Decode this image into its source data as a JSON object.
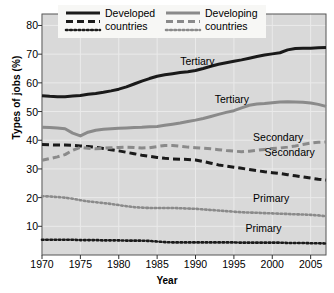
{
  "chart_data": {
    "type": "line",
    "title": "",
    "xlabel": "Year",
    "ylabel": "Types of jobs (%)",
    "xlim": [
      1970,
      2007
    ],
    "ylim": [
      0,
      84
    ],
    "xticks": [
      1970,
      1975,
      1980,
      1985,
      1990,
      1995,
      2000,
      2005
    ],
    "yticks": [
      10,
      20,
      30,
      40,
      50,
      60,
      70,
      80
    ],
    "grid": true,
    "legend_position": "top-center",
    "plot_background": "#d9d9d9",
    "gridline_color": "#eaeaea",
    "colors": {
      "developed": "#1a1a1a",
      "developing": "#8a8a8a"
    },
    "legend": [
      {
        "group": "developed",
        "label_line1": "Developed",
        "label_line2": "countries",
        "styles": [
          "solid",
          "dashed",
          "dotted"
        ],
        "color": "#1a1a1a"
      },
      {
        "group": "developing",
        "label_line1": "Developing",
        "label_line2": "countries",
        "styles": [
          "solid",
          "dashed",
          "dotted"
        ],
        "color": "#8a8a8a"
      }
    ],
    "annotations": [
      {
        "text": "Tertiary",
        "series": "developed_tertiary",
        "x": 1988.0,
        "y": 67.5
      },
      {
        "text": "Tertiary",
        "series": "developing_tertiary",
        "x": 1992.5,
        "y": 54.5
      },
      {
        "text": "Secondary",
        "series": "developing_secondary",
        "x": 1997.5,
        "y": 41.0
      },
      {
        "text": "Secondary",
        "series": "developed_secondary",
        "x": 1999.0,
        "y": 36.0
      },
      {
        "text": "Primary",
        "series": "developing_primary",
        "x": 1997.5,
        "y": 20.0
      },
      {
        "text": "Primary",
        "series": "developed_primary",
        "x": 1996.5,
        "y": 9.5
      }
    ],
    "x": [
      1970,
      1971,
      1972,
      1973,
      1974,
      1975,
      1976,
      1977,
      1978,
      1979,
      1980,
      1981,
      1982,
      1983,
      1984,
      1985,
      1986,
      1987,
      1988,
      1989,
      1990,
      1991,
      1992,
      1993,
      1994,
      1995,
      1996,
      1997,
      1998,
      1999,
      2000,
      2001,
      2002,
      2003,
      2004,
      2005,
      2006,
      2007
    ],
    "series": [
      {
        "name": "Developed countries - Tertiary",
        "group": "developed",
        "category": "Tertiary",
        "style": "solid",
        "color": "#1a1a1a",
        "values": [
          55.5,
          55.3,
          55.2,
          55.2,
          55.4,
          55.6,
          56.0,
          56.3,
          56.7,
          57.2,
          57.8,
          58.6,
          59.6,
          60.6,
          61.5,
          62.3,
          62.8,
          63.2,
          63.6,
          63.9,
          64.3,
          65.0,
          65.8,
          66.5,
          67.0,
          67.5,
          68.0,
          68.6,
          69.2,
          69.7,
          70.1,
          70.5,
          71.5,
          72.0,
          72.1,
          72.1,
          72.2,
          72.3
        ]
      },
      {
        "name": "Developing countries - Tertiary",
        "group": "developing",
        "category": "Tertiary",
        "style": "solid",
        "color": "#8a8a8a",
        "values": [
          44.5,
          44.4,
          44.3,
          44.0,
          42.5,
          41.5,
          42.8,
          43.5,
          43.8,
          44.0,
          44.2,
          44.3,
          44.4,
          44.5,
          44.7,
          44.8,
          45.2,
          45.6,
          46.0,
          46.5,
          47.0,
          47.6,
          48.3,
          49.0,
          49.7,
          50.3,
          51.3,
          52.2,
          52.6,
          52.8,
          53.1,
          53.3,
          53.4,
          53.3,
          53.2,
          53.0,
          52.5,
          51.8
        ]
      },
      {
        "name": "Developed countries - Secondary",
        "group": "developed",
        "category": "Secondary",
        "style": "dashed",
        "color": "#1a1a1a",
        "values": [
          38.5,
          38.4,
          38.3,
          38.3,
          38.2,
          38.0,
          37.8,
          37.5,
          37.1,
          36.7,
          36.3,
          35.8,
          35.3,
          34.8,
          34.4,
          34.0,
          33.7,
          33.5,
          33.4,
          33.3,
          33.1,
          32.6,
          32.0,
          31.4,
          31.0,
          30.6,
          30.2,
          29.8,
          29.4,
          29.0,
          28.7,
          28.4,
          28.0,
          27.6,
          27.2,
          26.8,
          26.4,
          26.1
        ]
      },
      {
        "name": "Developing countries - Secondary",
        "group": "developing",
        "category": "Secondary",
        "style": "dashed",
        "color": "#8a8a8a",
        "values": [
          33.0,
          33.6,
          34.2,
          35.0,
          36.5,
          37.5,
          37.2,
          37.0,
          37.2,
          37.4,
          37.5,
          37.6,
          37.5,
          37.3,
          37.4,
          37.8,
          38.2,
          38.2,
          37.9,
          37.6,
          37.4,
          37.2,
          37.0,
          36.7,
          36.4,
          36.2,
          36.0,
          36.2,
          36.5,
          36.8,
          37.1,
          37.3,
          37.6,
          38.0,
          38.5,
          39.0,
          39.3,
          39.4
        ]
      },
      {
        "name": "Developing countries - Primary",
        "group": "developing",
        "category": "Primary",
        "style": "dotted",
        "color": "#8a8a8a",
        "values": [
          20.5,
          20.4,
          20.2,
          20.0,
          19.6,
          19.1,
          18.7,
          18.4,
          18.1,
          17.8,
          17.4,
          17.0,
          16.7,
          16.5,
          16.4,
          16.4,
          16.4,
          16.4,
          16.3,
          16.2,
          16.1,
          15.9,
          15.7,
          15.5,
          15.3,
          15.1,
          14.9,
          14.8,
          14.7,
          14.6,
          14.5,
          14.4,
          14.3,
          14.2,
          14.1,
          14.0,
          13.8,
          13.5
        ]
      },
      {
        "name": "Developed countries - Primary",
        "group": "developed",
        "category": "Primary",
        "style": "dotted",
        "color": "#1a1a1a",
        "values": [
          5.3,
          5.3,
          5.3,
          5.3,
          5.3,
          5.2,
          5.2,
          5.2,
          5.1,
          5.1,
          5.1,
          5.0,
          5.0,
          5.0,
          4.9,
          4.7,
          4.5,
          4.4,
          4.4,
          4.4,
          4.4,
          4.4,
          4.4,
          4.4,
          4.4,
          4.4,
          4.3,
          4.3,
          4.3,
          4.3,
          4.3,
          4.3,
          4.2,
          4.2,
          4.2,
          4.1,
          4.1,
          4.0
        ]
      }
    ]
  }
}
